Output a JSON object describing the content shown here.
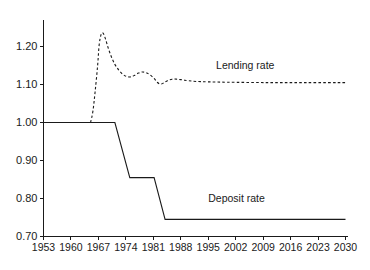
{
  "chart_data": {
    "type": "line",
    "title": "",
    "subtitle": "",
    "xlabel": "",
    "ylabel": "",
    "grid": false,
    "legend_position": "inline-annotation",
    "xlim": [
      1953,
      2030
    ],
    "ylim": [
      0.7,
      1.26
    ],
    "x_ticks": [
      1953,
      1960,
      1967,
      1974,
      1981,
      1988,
      1995,
      2002,
      2009,
      2016,
      2023,
      2030
    ],
    "x_tick_labels": [
      "1953",
      "1960",
      "1967",
      "1974",
      "1981",
      "1988",
      "1995",
      "2002",
      "2009",
      "2016",
      "2023",
      "2030"
    ],
    "y_ticks": [
      0.7,
      0.8,
      0.9,
      1.0,
      1.1,
      1.2
    ],
    "y_tick_labels": [
      "0.70",
      "0.80",
      "0.90",
      "1.00",
      "1.10",
      "1.20"
    ],
    "series": [
      {
        "name": "Lending rate",
        "style": "dashed",
        "color": "#1a1a1a",
        "label_x": 1997,
        "label_y": 1.142,
        "points": [
          [
            1965.0,
            1.0
          ],
          [
            1965.6,
            1.03
          ],
          [
            1966.2,
            1.085
          ],
          [
            1966.8,
            1.15
          ],
          [
            1967.2,
            1.205
          ],
          [
            1967.7,
            1.232
          ],
          [
            1968.2,
            1.235
          ],
          [
            1968.8,
            1.22
          ],
          [
            1969.5,
            1.196
          ],
          [
            1970.3,
            1.173
          ],
          [
            1971.2,
            1.153
          ],
          [
            1972.2,
            1.138
          ],
          [
            1973.2,
            1.127
          ],
          [
            1974.2,
            1.121
          ],
          [
            1975.2,
            1.12
          ],
          [
            1976.2,
            1.124
          ],
          [
            1977.2,
            1.13
          ],
          [
            1978.2,
            1.133
          ],
          [
            1979.2,
            1.131
          ],
          [
            1980.2,
            1.125
          ],
          [
            1981.2,
            1.116
          ],
          [
            1982.0,
            1.106
          ],
          [
            1982.8,
            1.101
          ],
          [
            1983.6,
            1.104
          ],
          [
            1984.6,
            1.11
          ],
          [
            1985.8,
            1.114
          ],
          [
            1987.0,
            1.114
          ],
          [
            1988.5,
            1.112
          ],
          [
            1990.0,
            1.11
          ],
          [
            1992.0,
            1.108
          ],
          [
            1995.0,
            1.107
          ],
          [
            2000.0,
            1.106
          ],
          [
            2010.0,
            1.105
          ],
          [
            2020.0,
            1.105
          ],
          [
            2030.0,
            1.105
          ]
        ]
      },
      {
        "name": "Deposit rate",
        "style": "solid",
        "color": "#1a1a1a",
        "label_x": 1995,
        "label_y": 0.79,
        "points": [
          [
            1953.0,
            1.0
          ],
          [
            1971.2,
            1.0
          ],
          [
            1975.0,
            0.855
          ],
          [
            1981.2,
            0.855
          ],
          [
            1984.0,
            0.745
          ],
          [
            2030.0,
            0.745
          ]
        ]
      }
    ]
  },
  "annotations": {
    "lending_label": "Lending rate",
    "deposit_label": "Deposit rate"
  }
}
